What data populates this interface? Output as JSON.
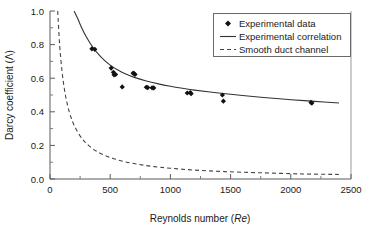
{
  "chart_data": {
    "type": "scatter",
    "title": "",
    "xlabel": "Reynolds number (Re)",
    "xlabel_plain": "Reynolds number",
    "xlabel_italic": "Re",
    "ylabel": "Darcy coefficient (Λ)",
    "ylabel_plain": "Darcy coefficient",
    "ylabel_symbol": "Λ",
    "xlim": [
      0,
      2500
    ],
    "ylim": [
      0.0,
      1.0
    ],
    "xticks": [
      0,
      500,
      1000,
      1500,
      2000,
      2500
    ],
    "xtick_labels": [
      "0",
      "500",
      "1000",
      "1500",
      "2000",
      "2500"
    ],
    "xminor_step": 250,
    "yticks": [
      0.0,
      0.2,
      0.4,
      0.6,
      0.8,
      1.0
    ],
    "ytick_labels": [
      "0.0",
      "0.2",
      "0.4",
      "0.6",
      "0.8",
      "1.0"
    ],
    "yminor_step": 0.1,
    "grid": false,
    "legend_position": "top-right",
    "series": [
      {
        "name": "Experimental data",
        "type": "scatter",
        "marker": "diamond",
        "color": "#111111",
        "points": [
          {
            "x": 348,
            "y": 0.775
          },
          {
            "x": 372,
            "y": 0.772
          },
          {
            "x": 508,
            "y": 0.66
          },
          {
            "x": 527,
            "y": 0.635
          },
          {
            "x": 532,
            "y": 0.62
          },
          {
            "x": 545,
            "y": 0.622
          },
          {
            "x": 600,
            "y": 0.548
          },
          {
            "x": 690,
            "y": 0.63
          },
          {
            "x": 700,
            "y": 0.627
          },
          {
            "x": 706,
            "y": 0.622
          },
          {
            "x": 800,
            "y": 0.546
          },
          {
            "x": 812,
            "y": 0.544
          },
          {
            "x": 848,
            "y": 0.543
          },
          {
            "x": 862,
            "y": 0.542
          },
          {
            "x": 1140,
            "y": 0.512
          },
          {
            "x": 1165,
            "y": 0.515
          },
          {
            "x": 1172,
            "y": 0.508
          },
          {
            "x": 1432,
            "y": 0.5
          },
          {
            "x": 1440,
            "y": 0.463
          },
          {
            "x": 2168,
            "y": 0.456
          },
          {
            "x": 2175,
            "y": 0.452
          }
        ]
      },
      {
        "name": "Experimental correlation",
        "type": "line",
        "style": "solid",
        "color": "#333333",
        "x_start": 200,
        "x_end": 2400,
        "points": [
          {
            "x": 200,
            "y": 1.0
          },
          {
            "x": 230,
            "y": 0.955
          },
          {
            "x": 260,
            "y": 0.905
          },
          {
            "x": 300,
            "y": 0.848
          },
          {
            "x": 350,
            "y": 0.79
          },
          {
            "x": 400,
            "y": 0.745
          },
          {
            "x": 450,
            "y": 0.708
          },
          {
            "x": 500,
            "y": 0.678
          },
          {
            "x": 560,
            "y": 0.65
          },
          {
            "x": 620,
            "y": 0.628
          },
          {
            "x": 700,
            "y": 0.605
          },
          {
            "x": 800,
            "y": 0.583
          },
          {
            "x": 900,
            "y": 0.566
          },
          {
            "x": 1000,
            "y": 0.552
          },
          {
            "x": 1100,
            "y": 0.54
          },
          {
            "x": 1200,
            "y": 0.529
          },
          {
            "x": 1400,
            "y": 0.512
          },
          {
            "x": 1600,
            "y": 0.497
          },
          {
            "x": 1800,
            "y": 0.484
          },
          {
            "x": 2000,
            "y": 0.472
          },
          {
            "x": 2200,
            "y": 0.462
          },
          {
            "x": 2400,
            "y": 0.452
          }
        ]
      },
      {
        "name": "Smooth duct channel",
        "type": "line",
        "style": "dashed",
        "color": "#444444",
        "formula": "64/Re",
        "x_start": 64,
        "x_end": 2400,
        "points": [
          {
            "x": 64,
            "y": 1.0
          },
          {
            "x": 80,
            "y": 0.8
          },
          {
            "x": 100,
            "y": 0.64
          },
          {
            "x": 120,
            "y": 0.533
          },
          {
            "x": 140,
            "y": 0.457
          },
          {
            "x": 160,
            "y": 0.4
          },
          {
            "x": 180,
            "y": 0.356
          },
          {
            "x": 200,
            "y": 0.32
          },
          {
            "x": 240,
            "y": 0.267
          },
          {
            "x": 280,
            "y": 0.229
          },
          {
            "x": 320,
            "y": 0.2
          },
          {
            "x": 380,
            "y": 0.168
          },
          {
            "x": 450,
            "y": 0.142
          },
          {
            "x": 530,
            "y": 0.121
          },
          {
            "x": 620,
            "y": 0.103
          },
          {
            "x": 720,
            "y": 0.089
          },
          {
            "x": 850,
            "y": 0.075
          },
          {
            "x": 1000,
            "y": 0.064
          },
          {
            "x": 1200,
            "y": 0.053
          },
          {
            "x": 1450,
            "y": 0.044
          },
          {
            "x": 1750,
            "y": 0.037
          },
          {
            "x": 2100,
            "y": 0.03
          },
          {
            "x": 2400,
            "y": 0.027
          }
        ]
      }
    ],
    "legend": [
      {
        "label": "Experimental data",
        "marker": "diamond"
      },
      {
        "label": "Experimental correlation",
        "marker": "solid-line"
      },
      {
        "label": "Smooth duct channel",
        "marker": "dashed-line"
      }
    ]
  }
}
